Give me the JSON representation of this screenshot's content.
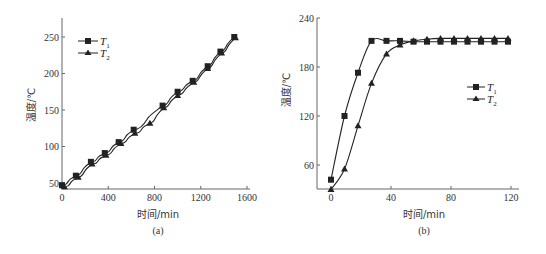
{
  "chart_data": [
    {
      "type": "line",
      "panel": "(a)",
      "title": "",
      "caption": "(a)",
      "xlabel": "时间/min",
      "ylabel": "温度/℃",
      "xlim": [
        0,
        1600
      ],
      "ylim": [
        45,
        270
      ],
      "xticks": [
        0,
        400,
        800,
        1200,
        1600
      ],
      "yticks": [
        50,
        100,
        150,
        200,
        250
      ],
      "grid": false,
      "legend_position": "upper-left",
      "series": [
        {
          "name": "T1",
          "marker": "square",
          "x": [
            0,
            120,
            250,
            370,
            490,
            620,
            870,
            1000,
            1130,
            1260,
            1370,
            1490
          ],
          "y": [
            47,
            60,
            79,
            91,
            106,
            123,
            156,
            175,
            190,
            210,
            230,
            250
          ]
        },
        {
          "name": "T2",
          "marker": "triangle",
          "x": [
            20,
            140,
            260,
            380,
            510,
            630,
            760,
            880,
            1000,
            1140,
            1260,
            1380,
            1500
          ],
          "y": [
            45,
            58,
            76,
            88,
            104,
            118,
            132,
            153,
            170,
            188,
            207,
            228,
            249
          ]
        }
      ]
    },
    {
      "type": "line",
      "panel": "(b)",
      "title": "",
      "caption": "(b)",
      "xlabel": "时间/min",
      "ylabel": "温度/℃",
      "xlim": [
        0,
        125
      ],
      "ylim": [
        30,
        240
      ],
      "xticks": [
        0,
        40,
        80,
        120
      ],
      "yticks": [
        60,
        120,
        180,
        240
      ],
      "grid": false,
      "legend_position": "center-right",
      "series": [
        {
          "name": "T1",
          "marker": "square",
          "x": [
            0,
            9,
            18,
            27,
            37,
            46,
            55,
            64,
            73,
            82,
            91,
            100,
            109,
            118
          ],
          "y": [
            42,
            120,
            173,
            212,
            212,
            212,
            211,
            211,
            211,
            211,
            211,
            211,
            211,
            211
          ]
        },
        {
          "name": "T2",
          "marker": "triangle",
          "x": [
            0,
            9,
            18,
            27,
            37,
            46,
            55,
            64,
            73,
            82,
            91,
            100,
            109,
            118
          ],
          "y": [
            30,
            55,
            108,
            160,
            196,
            207,
            212,
            214,
            215,
            215,
            215,
            215,
            215,
            215
          ]
        }
      ]
    }
  ],
  "labels": {
    "a": {
      "xlabel": "时间/min",
      "ylabel": "温度/℃",
      "caption": "(a)",
      "yticks": [
        "50",
        "100",
        "150",
        "200",
        "250"
      ],
      "xticks": [
        "0",
        "400",
        "800",
        "1200",
        "1600"
      ],
      "legend": [
        {
          "main": "T",
          "sub": "1"
        },
        {
          "main": "T",
          "sub": "2"
        }
      ]
    },
    "b": {
      "xlabel": "时间/min",
      "ylabel": "温度/℃",
      "caption": "(b)",
      "yticks": [
        "60",
        "120",
        "180",
        "240"
      ],
      "xticks": [
        "0",
        "40",
        "80",
        "120"
      ],
      "legend": [
        {
          "main": "T",
          "sub": "1"
        },
        {
          "main": "T",
          "sub": "2"
        }
      ]
    }
  },
  "colors": {
    "line": "#222222",
    "axis": "#555555"
  }
}
